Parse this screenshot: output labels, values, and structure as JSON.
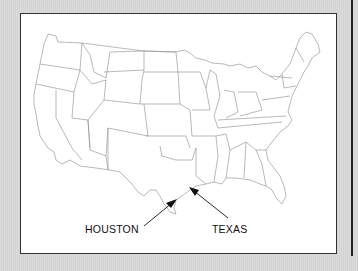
{
  "figure": {
    "type": "map",
    "region": "Contiguous United States",
    "style": "state outline map",
    "labels": [
      {
        "id": "houston",
        "text": "HOUSTON",
        "x": 85,
        "y": 222,
        "arrow_to": [
          177,
          200
        ]
      },
      {
        "id": "texas",
        "text": "TEXAS",
        "x": 212,
        "y": 222,
        "arrow_to": [
          190,
          188
        ]
      }
    ]
  },
  "colors": {
    "background": "#d9d9d9",
    "frame_border": "#333333",
    "map_fill": "#ffffff",
    "state_lines": "#8a8a8a",
    "arrow": "#111111"
  }
}
